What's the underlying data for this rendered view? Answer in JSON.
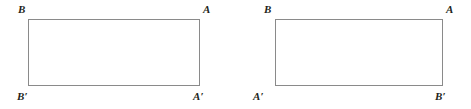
{
  "figures": [
    {
      "name": "rectangle-untwisted",
      "labels": {
        "top_left": "B",
        "top_right": "A",
        "bottom_left": "B′",
        "bottom_right": "A′"
      }
    },
    {
      "name": "rectangle-twisted",
      "labels": {
        "top_left": "B",
        "top_right": "A",
        "bottom_left": "A′",
        "bottom_right": "B′"
      }
    }
  ],
  "style": {
    "stroke_color": "#8a8a8a",
    "label_color": "#231f20",
    "background_color": "#ffffff"
  }
}
